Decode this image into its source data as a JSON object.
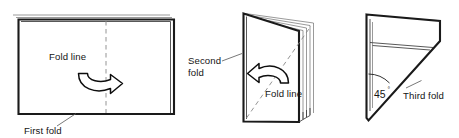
{
  "diagram": {
    "background_color": "#ffffff",
    "line_color": "#1a1a1a",
    "dash_color": "#888888",
    "panels": [
      {
        "id": "panel-first-fold",
        "step": 1,
        "shape": "flat rectangular sheet, slightly layered at top-left and right edges",
        "fold_line_label": "Fold line",
        "fold_line_orientation": "vertical center",
        "callout_label": "First fold",
        "arrow_direction": "left-to-right",
        "arrow_name": "fold-arrow-right"
      },
      {
        "id": "panel-second-fold",
        "step": 2,
        "shape": "upright booklet with spine at left and fanned page edges at right",
        "fold_line_label": "Fold line",
        "fold_line_orientation": "diagonal bottom-left to top-right",
        "callout_label": "Second fold",
        "callout_label_line1": "Second",
        "callout_label_line2": "fold",
        "arrow_direction": "right-to-left",
        "arrow_name": "fold-arrow-left"
      },
      {
        "id": "panel-third-fold",
        "step": 3,
        "shape": "pennant: rectangular top with 45 degree diagonal cut below",
        "angle_value": "45",
        "angle_unit": "°",
        "callout_label": "Third fold"
      }
    ]
  },
  "labels": {
    "fold_line_1": "Fold line",
    "first_fold": "First fold",
    "second_fold_line1": "Second",
    "second_fold_line2": "fold",
    "fold_line_2": "Fold line",
    "angle_number": "45",
    "angle_degree_symbol": "°",
    "third_fold": "Third fold"
  }
}
